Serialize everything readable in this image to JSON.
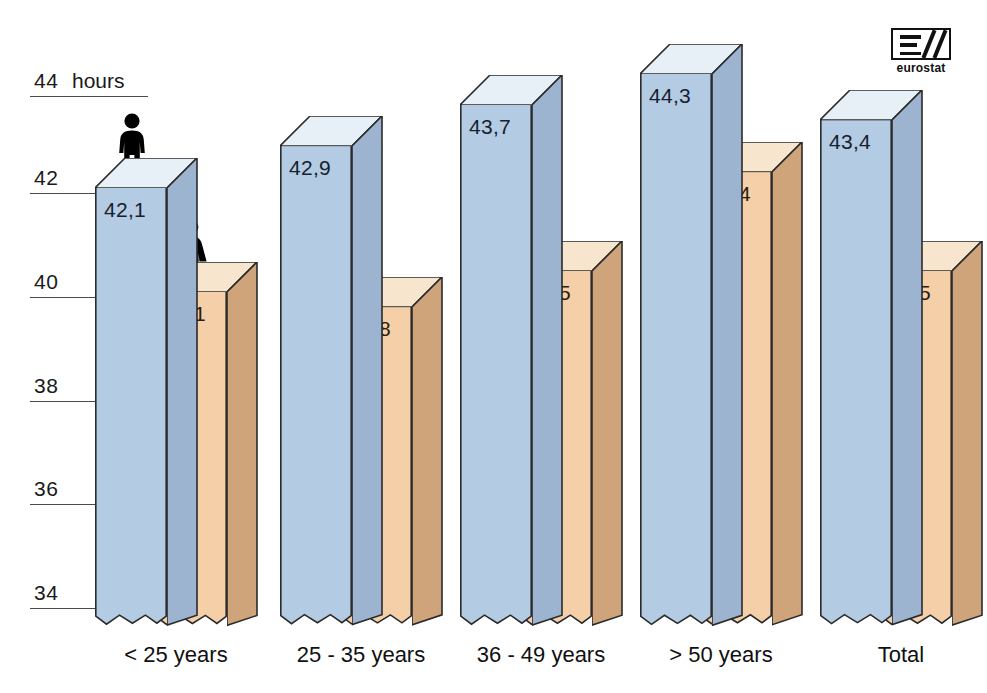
{
  "chart_data": {
    "type": "bar",
    "title": "",
    "subtitle": "",
    "xlabel": "",
    "ylabel": "hours",
    "unit_label": "hours",
    "categories": [
      "< 25 years",
      "25 - 35 years",
      "36 - 49 years",
      "> 50 years",
      "Total"
    ],
    "series": [
      {
        "name": "Men",
        "icon": "male-pictogram",
        "color": "#b4cbe4",
        "values": [
          42.1,
          42.9,
          43.7,
          44.3,
          43.4
        ],
        "labels": [
          "42,1",
          "42,9",
          "43,7",
          "44,3",
          "43,4"
        ]
      },
      {
        "name": "Women",
        "icon": "female-pictogram",
        "color": "#f4cfa8",
        "values": [
          40.1,
          39.8,
          40.5,
          42.4,
          40.5
        ],
        "labels": [
          "40,1",
          "39,8",
          "40,5",
          "42,4",
          "40,5"
        ]
      }
    ],
    "ylim": [
      33.3,
      44.6
    ],
    "yticks": [
      34,
      36,
      38,
      40,
      42,
      44
    ],
    "ytick_labels": [
      "34",
      "36",
      "38",
      "40",
      "42",
      "44"
    ],
    "grid": false,
    "legend_position": "none",
    "axis_broken": true,
    "style": "3d-bars"
  },
  "axis": {
    "ticks": [
      {
        "label": "44",
        "value": 44
      },
      {
        "label": "42",
        "value": 42
      },
      {
        "label": "40",
        "value": 40
      },
      {
        "label": "38",
        "value": 38
      },
      {
        "label": "36",
        "value": 36
      },
      {
        "label": "34",
        "value": 34
      }
    ],
    "unit": "hours"
  },
  "logo": {
    "name": "eurostat",
    "mark": "eurostat-logo-mark"
  },
  "colors": {
    "men_front": "#b4cbe4",
    "men_side": "#9cb4cf",
    "men_top": "#e7eff7",
    "women_front": "#f4cfa8",
    "women_side": "#cfa47a",
    "women_top": "#f7e6cd",
    "outline": "#2b2b2b",
    "axis": "#4a4a4a",
    "background": "#ffffff"
  }
}
